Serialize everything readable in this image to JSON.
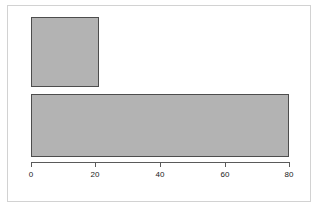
{
  "chart_data": {
    "type": "bar",
    "orientation": "horizontal",
    "title": "",
    "subtitle": "",
    "xlabel": "",
    "ylabel": "",
    "categories": [
      "",
      ""
    ],
    "values": [
      21,
      80
    ],
    "xlim": [
      0,
      80
    ],
    "xticks": [
      0,
      20,
      40,
      60,
      80
    ],
    "xtick_labels": [
      "0",
      "20",
      "40",
      "60",
      "80"
    ],
    "yticks": [],
    "ytick_labels": [],
    "grid": false,
    "legend": null,
    "bar_fill_color": "#b3b3b3",
    "bar_border_color": "#4d4d4d",
    "axis_color": "#5a5a5a",
    "frame_color": "#d2d2d2",
    "background_color": "#ffffff"
  },
  "bars": [
    {
      "name": "bar-1",
      "value": 21,
      "label": "",
      "left_px": 31,
      "top_px": 17,
      "width_px": 68,
      "height_px": 70
    },
    {
      "name": "bar-2",
      "value": 80,
      "label": "",
      "left_px": 31,
      "top_px": 94,
      "width_px": 258,
      "height_px": 63
    }
  ],
  "axis": {
    "name": "x-axis",
    "ticks": [
      {
        "label": "0",
        "x_px": 31
      },
      {
        "label": "20",
        "x_px": 95
      },
      {
        "label": "40",
        "x_px": 160
      },
      {
        "label": "60",
        "x_px": 225
      },
      {
        "label": "80",
        "x_px": 289
      }
    ]
  }
}
